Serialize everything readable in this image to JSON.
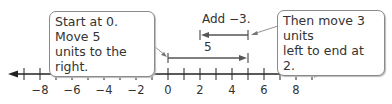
{
  "callouts": {
    "left": {
      "line1": "Start at 0. Move 5",
      "line2": "units to the right."
    },
    "right": {
      "line1": "Then move 3 units",
      "line2": "left to end at 2."
    }
  },
  "labels": {
    "add": "Add −3.",
    "five": "5"
  },
  "number_line": {
    "min": -9,
    "max": 9,
    "tick_labels": [
      "−8",
      "−6",
      "−4",
      "−2",
      "0",
      "2",
      "4",
      "6",
      "8"
    ],
    "tick_values": [
      -8,
      -6,
      -4,
      -2,
      0,
      2,
      4,
      6,
      8
    ]
  },
  "arrows": [
    {
      "from": 0,
      "to": 5,
      "label": "5"
    },
    {
      "from": 5,
      "to": 2,
      "label": "Add −3."
    }
  ]
}
